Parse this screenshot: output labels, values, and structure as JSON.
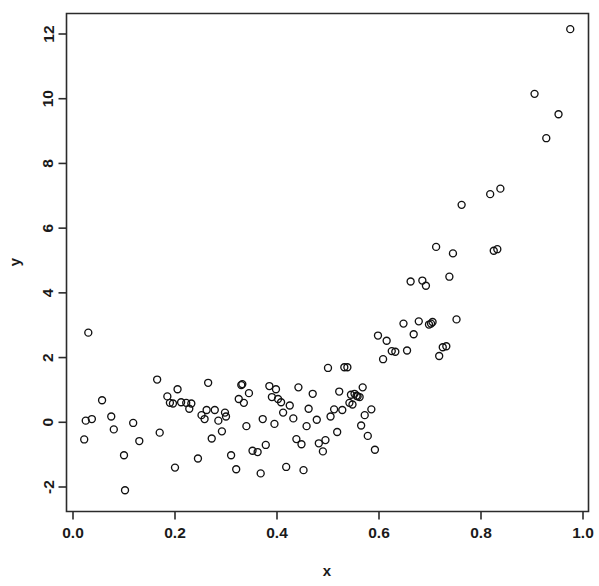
{
  "chart_data": {
    "type": "scatter",
    "title": "",
    "xlabel": "x",
    "ylabel": "y",
    "xlim": [
      -0.035,
      1.01
    ],
    "ylim": [
      -2.45,
      12.55
    ],
    "grid": false,
    "legend": null,
    "marker": "open-circle",
    "marker_color": "#111111",
    "background_color": "#ffffff",
    "xticks": [
      0.0,
      0.2,
      0.4,
      0.6,
      0.8,
      1.0
    ],
    "xticklabels": [
      "0.0",
      "0.2",
      "0.4",
      "0.6",
      "0.8",
      "1.0"
    ],
    "yticks": [
      -2,
      0,
      2,
      4,
      6,
      8,
      10,
      12
    ],
    "yticklabels": [
      "-2",
      "0",
      "2",
      "4",
      "6",
      "8",
      "10",
      "12"
    ],
    "n_points": 118,
    "x": [
      0.025,
      0.03,
      0.037,
      0.022,
      0.057,
      0.075,
      0.08,
      0.1,
      0.102,
      0.118,
      0.13,
      0.165,
      0.17,
      0.185,
      0.19,
      0.196,
      0.2,
      0.205,
      0.212,
      0.222,
      0.228,
      0.232,
      0.245,
      0.252,
      0.258,
      0.262,
      0.265,
      0.272,
      0.278,
      0.285,
      0.292,
      0.298,
      0.3,
      0.31,
      0.32,
      0.325,
      0.33,
      0.332,
      0.335,
      0.34,
      0.345,
      0.352,
      0.362,
      0.368,
      0.372,
      0.378,
      0.385,
      0.39,
      0.395,
      0.398,
      0.402,
      0.408,
      0.412,
      0.418,
      0.425,
      0.432,
      0.438,
      0.442,
      0.448,
      0.452,
      0.458,
      0.462,
      0.47,
      0.478,
      0.482,
      0.49,
      0.495,
      0.5,
      0.505,
      0.512,
      0.518,
      0.522,
      0.528,
      0.532,
      0.538,
      0.542,
      0.545,
      0.548,
      0.552,
      0.556,
      0.558,
      0.562,
      0.565,
      0.568,
      0.572,
      0.578,
      0.585,
      0.592,
      0.598,
      0.608,
      0.615,
      0.625,
      0.632,
      0.648,
      0.655,
      0.662,
      0.668,
      0.678,
      0.685,
      0.692,
      0.698,
      0.702,
      0.705,
      0.712,
      0.718,
      0.725,
      0.732,
      0.738,
      0.745,
      0.752,
      0.762,
      0.818,
      0.825,
      0.832,
      0.838,
      0.905,
      0.928,
      0.952,
      0.975
    ],
    "y": [
      0.05,
      2.77,
      0.1,
      -0.53,
      0.68,
      0.18,
      -0.22,
      -1.02,
      -2.1,
      -0.02,
      -0.58,
      1.32,
      -0.32,
      0.8,
      0.6,
      0.58,
      -1.4,
      1.02,
      0.62,
      0.6,
      0.42,
      0.58,
      -1.12,
      0.22,
      0.1,
      0.38,
      1.22,
      -0.5,
      0.38,
      0.05,
      -0.28,
      0.3,
      0.18,
      -1.02,
      -1.45,
      0.72,
      1.15,
      1.18,
      0.6,
      -0.12,
      0.9,
      -0.88,
      -0.92,
      -1.58,
      0.1,
      -0.7,
      1.12,
      0.78,
      -0.05,
      1.02,
      0.72,
      0.62,
      0.3,
      -1.38,
      0.52,
      0.12,
      -0.52,
      1.08,
      -0.68,
      -1.48,
      -0.12,
      0.42,
      0.88,
      0.08,
      -0.65,
      -0.9,
      -0.55,
      1.68,
      0.18,
      0.4,
      -0.3,
      0.95,
      0.38,
      1.7,
      1.7,
      0.6,
      0.85,
      0.55,
      0.88,
      0.82,
      0.8,
      0.78,
      -0.1,
      1.08,
      0.22,
      -0.42,
      0.4,
      -0.85,
      2.68,
      1.95,
      2.52,
      2.2,
      2.18,
      3.05,
      2.22,
      4.35,
      2.72,
      3.12,
      4.38,
      4.22,
      3.02,
      3.05,
      3.1,
      5.42,
      2.05,
      2.32,
      2.35,
      4.5,
      5.22,
      3.18,
      6.72,
      7.05,
      5.3,
      5.35,
      7.22,
      10.15,
      8.78,
      9.52,
      12.15
    ]
  }
}
